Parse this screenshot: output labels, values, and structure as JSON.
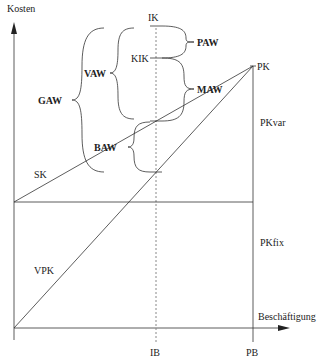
{
  "diagram": {
    "axes": {
      "y_label": "Kosten",
      "x_label": "Beschäftigung"
    },
    "x_ticks": {
      "ib": "IB",
      "pb": "PB"
    },
    "points": {
      "ik": "IK",
      "kik": "KIK",
      "pk": "PK"
    },
    "lines": {
      "sk": "SK",
      "vpk": "VPK"
    },
    "right_labels": {
      "pkvar": "PKvar",
      "pkfix": "PKfix"
    },
    "braces": {
      "gaw": "GAW",
      "vaw": "VAW",
      "paw": "PAW",
      "maw": "MAW",
      "baw": "BAW"
    }
  }
}
